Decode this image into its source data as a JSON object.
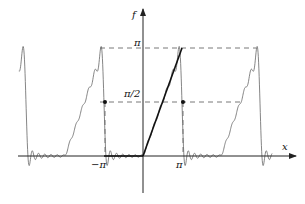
{
  "chart_data": {
    "type": "line",
    "title": "",
    "xlabel": "x",
    "ylabel": "f",
    "x_tick_labels": [
      "−π",
      "π"
    ],
    "x_ticks": [
      -3.14159,
      3.14159
    ],
    "y_tick_labels": [
      "π",
      "π/2"
    ],
    "y_ticks": [
      3.14159,
      1.5708
    ],
    "xlim": [
      -11.0,
      13.0
    ],
    "ylim": [
      -3.0,
      9.0
    ],
    "grid": false,
    "series": [
      {
        "name": "exact f(x) = x on [0, π]",
        "style": "bold-solid",
        "x": [
          0,
          3.14159
        ],
        "y": [
          0,
          3.14159
        ]
      },
      {
        "name": "Fourier partial sum (Gibbs oscillations)",
        "style": "thin-solid",
        "periodic_of": "f(x)=x for 0<x<π, 0 for -π<x<0, period 2π",
        "range": [
          -10.0,
          10.4
        ]
      }
    ],
    "reference_lines": [
      {
        "name": "level-pi",
        "y": 3.14159,
        "style": "dashed"
      },
      {
        "name": "level-half-pi",
        "y": 1.5708,
        "style": "dashed"
      }
    ],
    "points": [
      {
        "name": "midpoint-at-minus-pi",
        "x": -3.14159,
        "y": 1.5708
      },
      {
        "name": "midpoint-at-pi",
        "x": 3.14159,
        "y": 1.5708
      }
    ]
  },
  "labels": {
    "x_axis": "x",
    "y_axis": "f",
    "pi": "π",
    "half_pi": "π/2",
    "minus_pi_tick": "−π",
    "pi_tick": "π"
  }
}
